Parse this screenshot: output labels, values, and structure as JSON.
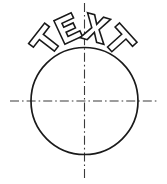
{
  "drawing": {
    "title": "TEXT",
    "text_string": "TEXT",
    "letters": [
      {
        "char": "T",
        "rotation_deg": -52,
        "center_x": 46.5,
        "center_y": 41.0
      },
      {
        "char": "E",
        "rotation_deg": -25,
        "center_x": 68.0,
        "center_y": 28.5
      },
      {
        "char": "X",
        "rotation_deg": 16,
        "center_x": 95.5,
        "center_y": 28.5
      },
      {
        "char": "T",
        "rotation_deg": 48,
        "center_x": 119.0,
        "center_y": 41.0
      }
    ],
    "circle": {
      "center_x": 84.5,
      "center_y": 101.0,
      "radius": 53.5,
      "diameter": 107,
      "stroke_color": "#1a1a1a",
      "fill": "none"
    },
    "centerlines": {
      "style": "dash-dot",
      "stroke_color": "#3a3a3a",
      "horizontal": {
        "x1": 10,
        "y1": 101,
        "x2": 157,
        "y2": 101
      },
      "vertical": {
        "x1": 84.5,
        "y1": 3,
        "x2": 84.5,
        "y2": 179
      }
    },
    "text_arc": {
      "radius": 66,
      "center_x": 84.5,
      "center_y": 101.0,
      "placement": "above-circle-outside",
      "letter_height": 26,
      "letter_style": "outlined-hollow"
    },
    "background_color": "#ffffff",
    "line_color": "#1a1a1a"
  }
}
